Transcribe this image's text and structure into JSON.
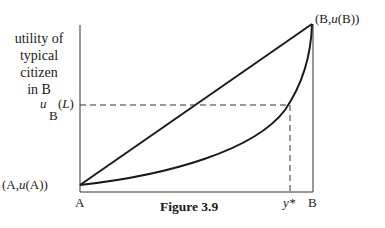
{
  "figure": {
    "caption": "Figure 3.9",
    "y_axis_label": [
      "utility of",
      "typical",
      "citizen",
      "in B"
    ],
    "x_axis": {
      "left_tick": "A",
      "right_tick": "B",
      "marked_point": "y*"
    },
    "points": {
      "start": {
        "label_prefix": "(A,",
        "u": "u",
        "label_suffix": "(A))"
      },
      "end": {
        "label_prefix": "(B,",
        "u": "u",
        "label_suffix": "(B))"
      }
    },
    "reference_level": {
      "symbol": "u",
      "subscript": "B",
      "argument_open": "(",
      "argument": "L",
      "argument_close": ")"
    },
    "curves": [
      {
        "name": "straight line",
        "type": "linear",
        "from": "(A,u(A))",
        "to": "(B,u(B))"
      },
      {
        "name": "convex curve",
        "type": "convex",
        "from": "(A,u(A))",
        "to": "(B,u(B))"
      }
    ],
    "colors": {
      "ink": "#1a1a1a",
      "background": "#ffffff"
    }
  }
}
